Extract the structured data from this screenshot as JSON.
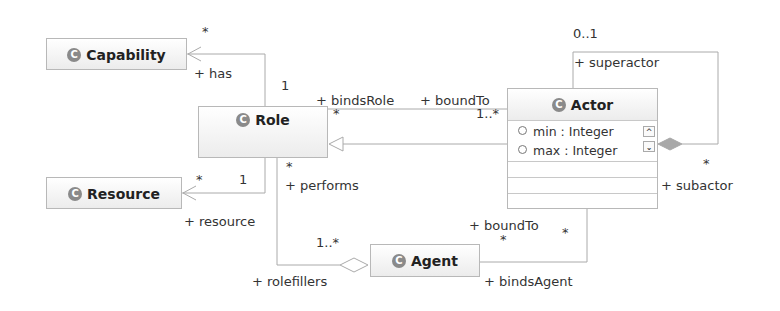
{
  "diagram": {
    "classes": {
      "capability": {
        "name": "Capability",
        "icon": "class-icon"
      },
      "role": {
        "name": "Role",
        "icon": "class-icon"
      },
      "resource": {
        "name": "Resource",
        "icon": "class-icon"
      },
      "actor": {
        "name": "Actor",
        "icon": "class-icon",
        "attributes": [
          {
            "text": "min : Integer"
          },
          {
            "text": "max : Integer"
          }
        ]
      },
      "agent": {
        "name": "Agent",
        "icon": "class-icon"
      }
    },
    "associations": {
      "role_capability": {
        "target_role": "+ has",
        "target_mult": "*",
        "source_mult": "1"
      },
      "role_resource": {
        "target_role": "+ resource",
        "target_mult": "*",
        "source_mult": "1"
      },
      "role_actor": {
        "role_end": "+ bindsRole",
        "role_mult": "*",
        "actor_end": "+ boundTo",
        "actor_mult": "1..*"
      },
      "role_agent": {
        "role_end": "+ performs",
        "role_mult": "*",
        "agent_end": "+ rolefillers",
        "agent_mult": "1..*"
      },
      "agent_actor": {
        "actor_end": "+ boundTo",
        "actor_mult": "*",
        "agent_end": "+ bindsAgent",
        "agent_mult": "*"
      },
      "actor_self": {
        "super_end": "+ superactor",
        "super_mult": "0..1",
        "sub_end": "+ subactor",
        "sub_mult": "*"
      }
    },
    "glyphs": {
      "class_icon": "C",
      "scroll_up": "^",
      "scroll_down": "⌄"
    }
  }
}
